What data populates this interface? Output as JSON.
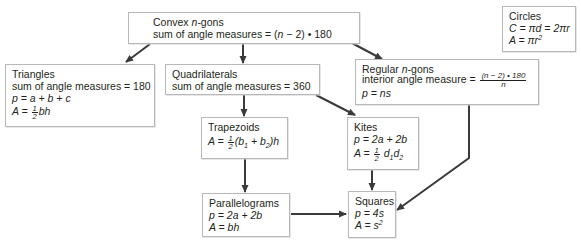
{
  "diagram": {
    "nodes": {
      "convex": {
        "title_prefix": "Convex ",
        "title_var": "n",
        "title_suffix": "-gons",
        "line2_text": "sum of angle measures = (",
        "line2_var": "n",
        "line2_suffix": " − 2) • 180"
      },
      "circles": {
        "title": "Circles",
        "circumference": "C = πd = 2πr",
        "area": "A = πr",
        "area_exp": "2"
      },
      "triangles": {
        "title": "Triangles",
        "angle_sum": "sum of angle measures = 180",
        "perimeter": "p = a + b + c",
        "area_prefix": "A = ",
        "area_frac_num": "1",
        "area_frac_den": "2",
        "area_suffix": "bh"
      },
      "quadrilaterals": {
        "title": "Quadrilaterals",
        "angle_sum": "sum of angle measures = 360"
      },
      "regular_ngons": {
        "title_prefix": "Regular ",
        "title_var": "n",
        "title_suffix": "-gons",
        "interior_label": "interior angle measure = ",
        "interior_num": "(n − 2) • 180",
        "interior_den": "n",
        "perimeter": "p = ns"
      },
      "trapezoids": {
        "title": "Trapezoids",
        "area_prefix": "A = ",
        "area_frac_num": "1",
        "area_frac_den": "2",
        "area_b": "(b",
        "area_sub1": "1",
        "area_mid": " + b",
        "area_sub2": "2",
        "area_suffix": ")h"
      },
      "kites": {
        "title": "Kites",
        "perimeter": "p = 2a + 2b",
        "area_prefix": "A = ",
        "area_frac_num": "1",
        "area_frac_den": "2",
        "area_d1": " d",
        "area_sub1": "1",
        "area_d2": "d",
        "area_sub2": "2"
      },
      "parallelograms": {
        "title": "Parallelograms",
        "perimeter": "p = 2a + 2b",
        "area": "A = bh"
      },
      "squares": {
        "title": "Squares",
        "perimeter": "p = 4s",
        "area": "A = s",
        "area_exp": "2"
      }
    },
    "edges": [
      {
        "from": "convex",
        "to": "triangles"
      },
      {
        "from": "convex",
        "to": "quadrilaterals"
      },
      {
        "from": "convex",
        "to": "regular_ngons"
      },
      {
        "from": "quadrilaterals",
        "to": "trapezoids"
      },
      {
        "from": "quadrilaterals",
        "to": "kites"
      },
      {
        "from": "trapezoids",
        "to": "parallelograms"
      },
      {
        "from": "kites",
        "to": "squares"
      },
      {
        "from": "parallelograms",
        "to": "squares"
      },
      {
        "from": "regular_ngons",
        "to": "squares"
      }
    ],
    "colors": {
      "border": "#b8b8b8",
      "arrow": "#3a3a3a",
      "text": "#231f20"
    }
  }
}
